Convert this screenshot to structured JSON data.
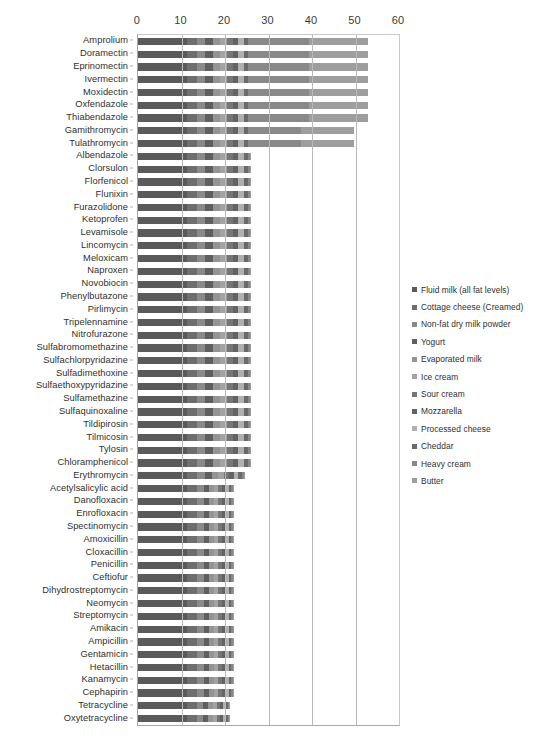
{
  "chart_data": {
    "type": "bar",
    "subtype": "stacked-horizontal-bar",
    "title": "",
    "xlabel": "",
    "ylabel": "",
    "xlim": [
      0,
      60
    ],
    "xticks": [
      0,
      10,
      20,
      30,
      40,
      50,
      60
    ],
    "xtick_labels": [
      "0",
      "10",
      "20",
      "30",
      "40",
      "50",
      "60"
    ],
    "grid": true,
    "legend_position": "right",
    "categories": [
      "Amprolium",
      "Doramectin",
      "Eprinomectin",
      "Ivermectin",
      "Moxidectin",
      "Oxfendazole",
      "Thiabendazole",
      "Gamithromycin",
      "Tulathromycin",
      "Albendazole",
      "Clorsulon",
      "Florfenicol",
      "Flunixin",
      "Furazolidone",
      "Ketoprofen",
      "Levamisole",
      "Lincomycin",
      "Meloxicam",
      "Naproxen",
      "Novobiocin",
      "Phenylbutazone",
      "Pirlimycin",
      "Tripelennamine",
      "Nitrofurazone",
      "Sulfabromomethazine",
      "Sulfachlorpyridazine",
      "Sulfadimethoxine",
      "Sulfaethoxypyridazine",
      "Sulfamethazine",
      "Sulfaquinoxaline",
      "Tildipirosin",
      "Tilmicosin",
      "Tylosin",
      "Chloramphenicol",
      "Erythromycin",
      "Acetylsalicylic acid",
      "Danofloxacin",
      "Enrofloxacin",
      "Spectinomycin",
      "Amoxicillin",
      "Cloxacillin",
      "Penicillin",
      "Ceftiofur",
      "Dihydrostreptomycin",
      "Neomycin",
      "Streptomycin",
      "Amikacin",
      "Ampicillin",
      "Gentamicin",
      "Hetacillin",
      "Kanamycin",
      "Cephapirin",
      "Tetracycline",
      "Oxytetracycline"
    ],
    "series": [
      {
        "name": "Fluid milk (all fat levels)",
        "color": "#5a5a5a",
        "values": [
          11.2,
          11.2,
          11.2,
          11.2,
          11.2,
          11.2,
          11.2,
          11.2,
          11.2,
          11.2,
          11.2,
          11.2,
          11.2,
          11.2,
          11.2,
          11.2,
          11.2,
          11.2,
          11.2,
          11.2,
          11.2,
          11.2,
          11.2,
          11.2,
          11.2,
          11.2,
          11.2,
          11.2,
          11.2,
          11.2,
          11.2,
          11.2,
          11.2,
          11.2,
          11.2,
          11.2,
          11.2,
          11.2,
          11.2,
          11.2,
          11.2,
          11.2,
          11.2,
          11.2,
          11.2,
          11.2,
          11.2,
          11.2,
          11.2,
          11.2,
          11.2,
          11.2,
          11.2,
          11.2
        ]
      },
      {
        "name": "Cottage cheese (Creamed)",
        "color": "#6e6e6e",
        "values": [
          2.3,
          2.3,
          2.3,
          2.3,
          2.3,
          2.3,
          2.3,
          2.3,
          2.3,
          2.3,
          2.3,
          2.3,
          2.3,
          2.3,
          2.3,
          2.3,
          2.3,
          2.3,
          2.3,
          2.3,
          2.3,
          2.3,
          2.3,
          2.3,
          2.3,
          2.3,
          2.3,
          2.3,
          2.3,
          2.3,
          2.3,
          2.3,
          2.3,
          2.3,
          2.3,
          2.3,
          2.3,
          2.3,
          2.3,
          2.3,
          2.3,
          2.3,
          2.3,
          2.3,
          2.3,
          2.3,
          2.3,
          2.3,
          2.3,
          2.3,
          2.3,
          2.3,
          2.3,
          2.3
        ]
      },
      {
        "name": "Non-fat dry milk powder",
        "color": "#8a8a8a",
        "values": [
          2.0,
          2.0,
          2.0,
          2.0,
          2.0,
          2.0,
          2.0,
          2.0,
          2.0,
          2.0,
          2.0,
          2.0,
          2.0,
          2.0,
          2.0,
          2.0,
          2.0,
          2.0,
          2.0,
          2.0,
          2.0,
          2.0,
          2.0,
          2.0,
          2.0,
          2.0,
          2.0,
          2.0,
          2.0,
          2.0,
          2.0,
          2.0,
          2.0,
          2.0,
          2.0,
          1.6,
          1.6,
          1.6,
          1.6,
          1.6,
          1.6,
          1.6,
          1.6,
          1.6,
          1.6,
          1.6,
          1.6,
          1.6,
          1.6,
          1.6,
          1.6,
          1.6,
          1.5,
          1.5
        ]
      },
      {
        "name": "Yogurt",
        "color": "#5f5f5f",
        "values": [
          1.8,
          1.8,
          1.8,
          1.8,
          1.8,
          1.8,
          1.8,
          1.8,
          1.8,
          1.8,
          1.8,
          1.8,
          1.8,
          1.8,
          1.8,
          1.8,
          1.8,
          1.8,
          1.8,
          1.8,
          1.8,
          1.8,
          1.8,
          1.8,
          1.8,
          1.8,
          1.8,
          1.8,
          1.8,
          1.8,
          1.8,
          1.8,
          1.8,
          1.8,
          1.6,
          1.3,
          1.3,
          1.3,
          1.3,
          1.3,
          1.3,
          1.3,
          1.3,
          1.3,
          1.3,
          1.3,
          1.3,
          1.3,
          1.3,
          1.3,
          1.3,
          1.3,
          1.2,
          1.2
        ]
      },
      {
        "name": "Evaporated milk",
        "color": "#949494",
        "values": [
          1.6,
          1.6,
          1.6,
          1.6,
          1.6,
          1.6,
          1.6,
          1.6,
          1.6,
          1.6,
          1.6,
          1.6,
          1.6,
          1.6,
          1.6,
          1.6,
          1.6,
          1.6,
          1.6,
          1.6,
          1.6,
          1.6,
          1.6,
          1.6,
          1.6,
          1.6,
          1.6,
          1.6,
          1.6,
          1.6,
          1.6,
          1.6,
          1.6,
          1.6,
          1.4,
          1.1,
          1.1,
          1.1,
          1.1,
          1.1,
          1.1,
          1.1,
          1.1,
          1.1,
          1.1,
          1.1,
          1.1,
          1.1,
          1.1,
          1.1,
          1.1,
          1.1,
          1.0,
          1.0
        ]
      },
      {
        "name": "Ice cream",
        "color": "#a3a3a3",
        "values": [
          1.5,
          1.5,
          1.5,
          1.5,
          1.5,
          1.5,
          1.5,
          1.5,
          1.5,
          1.5,
          1.5,
          1.5,
          1.5,
          1.5,
          1.5,
          1.5,
          1.5,
          1.5,
          1.5,
          1.5,
          1.5,
          1.5,
          1.5,
          1.5,
          1.5,
          1.5,
          1.5,
          1.5,
          1.5,
          1.5,
          1.5,
          1.5,
          1.5,
          1.5,
          1.3,
          1.0,
          1.0,
          1.0,
          1.0,
          1.0,
          1.0,
          1.0,
          1.0,
          1.0,
          1.0,
          1.0,
          1.0,
          1.0,
          1.0,
          1.0,
          1.0,
          1.0,
          0.9,
          0.9
        ]
      },
      {
        "name": "Sour cream",
        "color": "#767676",
        "values": [
          1.4,
          1.4,
          1.4,
          1.4,
          1.4,
          1.4,
          1.4,
          1.4,
          1.4,
          1.4,
          1.4,
          1.4,
          1.4,
          1.4,
          1.4,
          1.4,
          1.4,
          1.4,
          1.4,
          1.4,
          1.4,
          1.4,
          1.4,
          1.4,
          1.4,
          1.4,
          1.4,
          1.4,
          1.4,
          1.4,
          1.4,
          1.4,
          1.4,
          1.4,
          1.2,
          0.9,
          0.9,
          0.9,
          0.9,
          0.9,
          0.9,
          0.9,
          0.9,
          0.9,
          0.9,
          0.9,
          0.9,
          0.9,
          0.9,
          0.9,
          0.9,
          0.9,
          0.8,
          0.8
        ]
      },
      {
        "name": "Mozzarella",
        "color": "#636363",
        "values": [
          1.3,
          1.3,
          1.3,
          1.3,
          1.3,
          1.3,
          1.3,
          1.3,
          1.3,
          1.3,
          1.3,
          1.3,
          1.3,
          1.3,
          1.3,
          1.3,
          1.3,
          1.3,
          1.3,
          1.3,
          1.3,
          1.3,
          1.3,
          1.3,
          1.3,
          1.3,
          1.3,
          1.3,
          1.3,
          1.3,
          1.3,
          1.3,
          1.3,
          1.3,
          1.1,
          0.8,
          0.8,
          0.8,
          0.8,
          0.8,
          0.8,
          0.8,
          0.8,
          0.8,
          0.8,
          0.8,
          0.8,
          0.8,
          0.8,
          0.8,
          0.8,
          0.8,
          0.7,
          0.7
        ]
      },
      {
        "name": "Processed cheese",
        "color": "#b0b0b0",
        "values": [
          1.2,
          1.2,
          1.2,
          1.2,
          1.2,
          1.2,
          1.2,
          1.2,
          1.2,
          1.2,
          1.2,
          1.2,
          1.2,
          1.2,
          1.2,
          1.2,
          1.2,
          1.2,
          1.2,
          1.2,
          1.2,
          1.2,
          1.2,
          1.2,
          1.2,
          1.2,
          1.2,
          1.2,
          1.2,
          1.2,
          1.2,
          1.2,
          1.2,
          1.2,
          1.0,
          0.7,
          0.7,
          0.7,
          0.7,
          0.7,
          0.7,
          0.7,
          0.7,
          0.7,
          0.7,
          0.7,
          0.7,
          0.7,
          0.7,
          0.7,
          0.7,
          0.7,
          0.6,
          0.6
        ]
      },
      {
        "name": "Cheddar",
        "color": "#6a6a6a",
        "values": [
          1.1,
          1.1,
          1.1,
          1.1,
          1.1,
          1.1,
          1.1,
          1.1,
          1.1,
          1.1,
          1.1,
          1.1,
          1.1,
          1.1,
          1.1,
          1.1,
          1.1,
          1.1,
          1.1,
          1.1,
          1.1,
          1.1,
          1.1,
          1.1,
          1.1,
          1.1,
          1.1,
          1.1,
          1.1,
          1.1,
          1.1,
          1.1,
          1.1,
          1.1,
          0.9,
          0.6,
          0.6,
          0.6,
          0.6,
          0.6,
          0.6,
          0.6,
          0.6,
          0.6,
          0.6,
          0.6,
          0.6,
          0.6,
          0.6,
          0.6,
          0.6,
          0.6,
          0.5,
          0.5
        ]
      },
      {
        "name": "Heavy cream",
        "color": "#898989",
        "values": [
          14.0,
          14.0,
          14.0,
          14.0,
          14.0,
          14.0,
          14.0,
          12.2,
          12.2,
          0.4,
          0.4,
          0.4,
          0.4,
          0.4,
          0.4,
          0.4,
          0.4,
          0.4,
          0.4,
          0.4,
          0.4,
          0.4,
          0.4,
          0.4,
          0.4,
          0.4,
          0.4,
          0.4,
          0.4,
          0.4,
          0.4,
          0.4,
          0.4,
          0.4,
          0.4,
          0.3,
          0.3,
          0.3,
          0.3,
          0.3,
          0.3,
          0.3,
          0.3,
          0.3,
          0.3,
          0.3,
          0.3,
          0.3,
          0.3,
          0.3,
          0.3,
          0.3,
          0.3,
          0.3
        ]
      },
      {
        "name": "Butter",
        "color": "#9e9e9e",
        "values": [
          13.6,
          13.6,
          13.6,
          13.6,
          13.6,
          13.6,
          13.6,
          12.0,
          12.0,
          0.3,
          0.3,
          0.3,
          0.3,
          0.3,
          0.3,
          0.3,
          0.3,
          0.3,
          0.3,
          0.3,
          0.3,
          0.3,
          0.3,
          0.3,
          0.3,
          0.3,
          0.3,
          0.3,
          0.3,
          0.3,
          0.3,
          0.3,
          0.3,
          0.3,
          0.3,
          0.2,
          0.2,
          0.2,
          0.2,
          0.2,
          0.2,
          0.2,
          0.2,
          0.2,
          0.2,
          0.2,
          0.2,
          0.2,
          0.2,
          0.2,
          0.2,
          0.2,
          0.2,
          0.2
        ]
      }
    ],
    "totals": [
      53.0,
      53.0,
      53.0,
      53.0,
      53.0,
      53.0,
      53.0,
      51.2,
      51.2,
      24.1,
      24.1,
      24.1,
      24.1,
      24.1,
      24.1,
      24.1,
      24.1,
      24.1,
      24.1,
      24.1,
      24.1,
      24.1,
      24.1,
      24.1,
      24.1,
      24.1,
      24.1,
      24.1,
      24.1,
      24.1,
      24.1,
      24.1,
      24.1,
      24.1,
      21.0,
      19.0,
      19.0,
      19.0,
      19.0,
      19.0,
      19.0,
      19.0,
      19.0,
      19.0,
      19.0,
      19.0,
      19.0,
      19.0,
      19.0,
      19.0,
      19.0,
      19.0,
      18.1,
      18.1
    ]
  },
  "legend": {
    "items": [
      "Fluid milk (all fat levels)",
      "Cottage cheese (Creamed)",
      "Non-fat dry milk powder",
      "Yogurt",
      "Evaporated milk",
      "Ice cream",
      "Sour cream",
      "Mozzarella",
      "Processed cheese",
      "Cheddar",
      "Heavy cream",
      "Butter"
    ]
  }
}
